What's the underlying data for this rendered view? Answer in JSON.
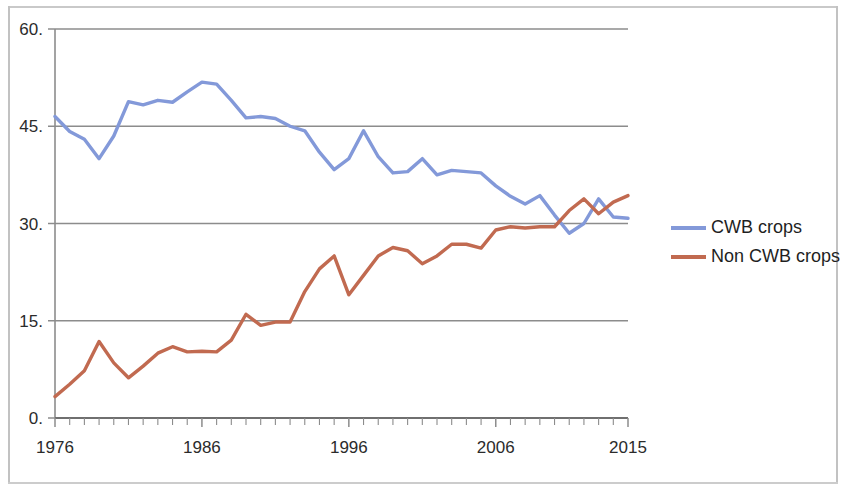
{
  "chart_data": {
    "type": "line",
    "title": "",
    "xlabel": "",
    "ylabel": "",
    "xlim": [
      1976,
      2015
    ],
    "ylim": [
      0,
      60
    ],
    "grid": true,
    "grid_axis": "y",
    "legend_position": "right",
    "y_ticks": [
      0,
      15,
      30,
      45,
      60
    ],
    "y_tick_labels": [
      "0.",
      "15.",
      "30.",
      "45.",
      "60."
    ],
    "x_ticks": [
      1976,
      1986,
      1996,
      2006,
      2015
    ],
    "x_tick_labels": [
      "1976",
      "1986",
      "1996",
      "2006",
      "2015"
    ],
    "x": [
      1976,
      1977,
      1978,
      1979,
      1980,
      1981,
      1982,
      1983,
      1984,
      1985,
      1986,
      1987,
      1988,
      1989,
      1990,
      1991,
      1992,
      1993,
      1994,
      1995,
      1996,
      1997,
      1998,
      1999,
      2000,
      2001,
      2002,
      2003,
      2004,
      2005,
      2006,
      2007,
      2008,
      2009,
      2010,
      2011,
      2012,
      2013,
      2014,
      2015
    ],
    "series": [
      {
        "name": "CWB crops",
        "color": "#8399D9",
        "values": [
          46.5,
          44.2,
          43.0,
          40.0,
          43.5,
          48.8,
          48.3,
          49.0,
          48.7,
          50.3,
          51.8,
          51.5,
          49.0,
          46.3,
          46.5,
          46.2,
          45.0,
          44.3,
          41.0,
          38.3,
          40.0,
          44.3,
          40.3,
          37.8,
          38.0,
          40.0,
          37.5,
          38.2,
          38.0,
          37.8,
          35.8,
          34.2,
          33.0,
          34.3,
          31.3,
          28.5,
          30.0,
          33.8,
          31.0,
          30.8
        ]
      },
      {
        "name": "Non CWB crops",
        "color": "#C16A50",
        "values": [
          3.3,
          5.2,
          7.3,
          11.8,
          8.5,
          6.2,
          8.0,
          10.0,
          11.0,
          10.2,
          10.3,
          10.2,
          12.0,
          16.0,
          14.3,
          14.8,
          14.8,
          19.5,
          23.0,
          25.0,
          19.0,
          22.0,
          25.0,
          26.3,
          25.8,
          23.8,
          25.0,
          26.8,
          26.8,
          26.2,
          29.0,
          29.5,
          29.3,
          29.5,
          29.5,
          32.0,
          33.8,
          31.5,
          33.3,
          34.3
        ]
      }
    ]
  },
  "legend": {
    "items": [
      {
        "label": "CWB crops",
        "color": "#8399D9"
      },
      {
        "label": "Non CWB crops",
        "color": "#C16A50"
      }
    ]
  },
  "axes": {
    "y_labels": [
      "60.",
      "45.",
      "30.",
      "15.",
      "0."
    ],
    "x_labels": [
      "1976",
      "1986",
      "1996",
      "2006",
      "2015"
    ]
  },
  "colors": {
    "cwb": "#8399D9",
    "non_cwb": "#C16A50",
    "gridline": "#8c8c8c",
    "axis": "#8c8c8c",
    "frame": "#c2c2c2",
    "text": "#2b2b2b"
  }
}
